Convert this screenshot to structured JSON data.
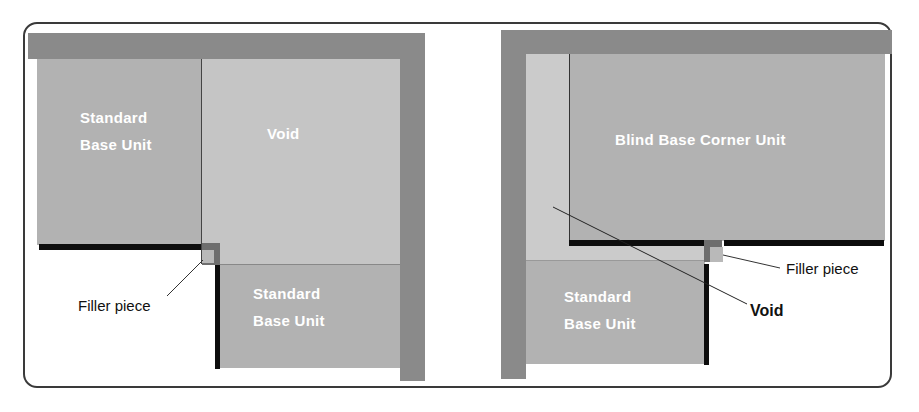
{
  "colors": {
    "wall": "#8a8a8a",
    "unit": "#b2b2b2",
    "void": "#c5c5c5",
    "void_strip": "#cbcbcb",
    "filler_dark": "#6e6e6e",
    "filler_light": "#b9b9b9",
    "door_edge": "#0d0d0d",
    "frame": "#3a3a3a"
  },
  "left_diagram": {
    "top_unit_label": "Standard\nBase Unit",
    "void_label": "Void",
    "bottom_unit_label": "Standard\nBase Unit",
    "filler_callout": "Filler piece"
  },
  "right_diagram": {
    "blind_unit_label": "Blind Base Corner Unit",
    "bottom_unit_label": "Standard\nBase Unit",
    "filler_callout": "Filler piece",
    "void_callout": "Void"
  }
}
